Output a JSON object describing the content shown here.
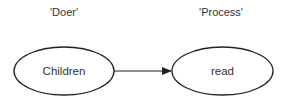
{
  "diagram": {
    "roles": [
      {
        "label": "'Doer'"
      },
      {
        "label": "'Process'"
      }
    ],
    "nodes": [
      {
        "id": "children",
        "label": "Children",
        "shape": "ellipse"
      },
      {
        "id": "read",
        "label": "read",
        "shape": "ellipse"
      }
    ],
    "edges": [
      {
        "from": "children",
        "to": "read",
        "type": "arrow"
      }
    ],
    "colors": {
      "stroke": "#222222",
      "text": "#333333",
      "background": "#ffffff"
    }
  }
}
